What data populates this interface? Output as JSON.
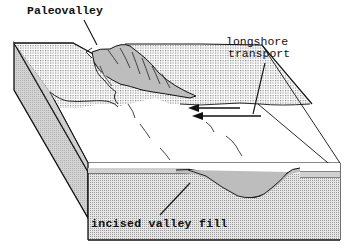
{
  "diagram": {
    "type": "block diagram",
    "labels": {
      "paleovalley": "Paleovalley",
      "longshore_line1": "longshore",
      "longshore_line2": "transport",
      "incised_valley_fill": "incised valley fill"
    },
    "arrows": [
      {
        "name": "longshore-arrow-upper",
        "direction": "left"
      },
      {
        "name": "longshore-arrow-lower",
        "direction": "left"
      }
    ],
    "colors": {
      "line": "#111111",
      "stipple_fill": "#d9d9d9",
      "valley_fill": "#bdbdbd",
      "side_face": "#cfcfcf",
      "background": "#ffffff"
    }
  }
}
